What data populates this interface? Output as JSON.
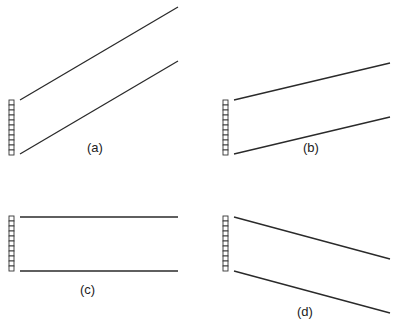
{
  "figure": {
    "panels": [
      {
        "id": "a",
        "label": "(a)",
        "array": {
          "x": 9,
          "y": 100,
          "cells": 11,
          "cell_w": 5,
          "cell_h": 5
        },
        "lines": [
          {
            "x1": 20,
            "y1": 100,
            "x2": 178,
            "y2": 7
          },
          {
            "x1": 20,
            "y1": 154,
            "x2": 178,
            "y2": 61
          }
        ],
        "label_pos": {
          "x": 87,
          "y": 147
        }
      },
      {
        "id": "b",
        "label": "(b)",
        "array": {
          "x": 223,
          "y": 100,
          "cells": 11,
          "cell_w": 5,
          "cell_h": 5
        },
        "lines": [
          {
            "x1": 234,
            "y1": 100,
            "x2": 390,
            "y2": 63
          },
          {
            "x1": 234,
            "y1": 154,
            "x2": 390,
            "y2": 117
          }
        ],
        "label_pos": {
          "x": 303,
          "y": 147
        }
      },
      {
        "id": "c",
        "label": "(c)",
        "array": {
          "x": 9,
          "y": 216,
          "cells": 11,
          "cell_w": 5,
          "cell_h": 5
        },
        "lines": [
          {
            "x1": 20,
            "y1": 217,
            "x2": 178,
            "y2": 217
          },
          {
            "x1": 20,
            "y1": 271,
            "x2": 178,
            "y2": 271
          }
        ],
        "label_pos": {
          "x": 80,
          "y": 289
        }
      },
      {
        "id": "d",
        "label": "(d)",
        "array": {
          "x": 223,
          "y": 216,
          "cells": 11,
          "cell_w": 5,
          "cell_h": 5
        },
        "lines": [
          {
            "x1": 234,
            "y1": 217,
            "x2": 390,
            "y2": 259
          },
          {
            "x1": 234,
            "y1": 271,
            "x2": 390,
            "y2": 313
          }
        ],
        "label_pos": {
          "x": 297,
          "y": 311
        }
      }
    ]
  }
}
